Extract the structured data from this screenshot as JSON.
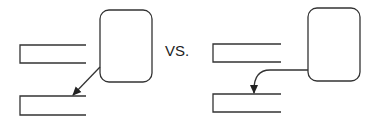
{
  "comparison": {
    "separator": "VS.",
    "left": {
      "label": "straight-diagonal-connector"
    },
    "right": {
      "label": "curved-elbow-connector"
    }
  },
  "colors": {
    "stroke": "#333333",
    "background": "#ffffff"
  }
}
